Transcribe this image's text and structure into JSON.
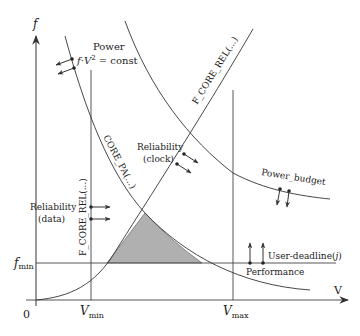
{
  "diagram": {
    "axes": {
      "y_label": "f",
      "x_label": "V",
      "origin_label": "0",
      "f_min_label": "f",
      "f_min_sub": "min",
      "v_min_label": "V",
      "v_min_sub": "min",
      "v_max_label": "V",
      "v_max_sub": "max"
    },
    "curves": {
      "core_pa_label": "CORE_PA(...)",
      "f_core_rel_clock_label": "F_CORE_REL(...)",
      "f_core_rel_data_label": "F_CORE_REL(...)",
      "power_budget_label": "Power_budget"
    },
    "annotations": {
      "power_title": "Power",
      "power_formula_f": "f",
      "power_formula_dot": "·",
      "power_formula_v": "V",
      "power_formula_exp": "2",
      "power_formula_rest": " = const",
      "reliability_clock_line1": "Reliability",
      "reliability_clock_line2": "(clock)",
      "reliability_data_line1": "Reliability",
      "reliability_data_line2": "(data)",
      "user_deadline": "User-deadline(",
      "user_deadline_var": "j",
      "user_deadline_close": ")",
      "performance": "Performance"
    },
    "colors": {
      "line": "#333333",
      "feasible_region": "#b0b0b0"
    }
  }
}
